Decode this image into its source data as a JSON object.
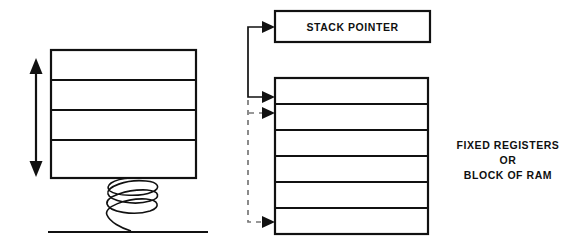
{
  "diagram": {
    "stack_pointer": {
      "label": "STACK POINTER",
      "box": {
        "x": 275,
        "y": 11,
        "width": 155,
        "height": 31
      }
    },
    "register_block": {
      "caption_lines": [
        "FIXED REGISTERS",
        "OR",
        "BLOCK OF RAM"
      ],
      "row_count": 6,
      "box": {
        "x": 275,
        "y": 78,
        "width": 153,
        "height": 156
      },
      "caption_position": {
        "x": 508,
        "y": 149
      }
    },
    "stack_box": {
      "row_count": 4,
      "box": {
        "x": 51,
        "y": 50,
        "width": 145,
        "height": 128
      }
    },
    "spring": {
      "name": "coil-spring",
      "coils": 4,
      "x_center": 130,
      "top": 178,
      "bottom": 232,
      "radius_x": 26
    },
    "ground": {
      "x1": 48,
      "x2": 208,
      "y": 232
    },
    "double_arrow": {
      "name": "vertical-travel-arrow",
      "x": 36,
      "top": 63,
      "bottom": 172
    },
    "connector": {
      "name": "stack-pointer-connector",
      "trunk_x": 248,
      "solid_top": 27,
      "solid_bottom": 100,
      "dashed_top": 100,
      "dashed_bottom": 215,
      "arrows": [
        {
          "name": "arrow-to-stack-pointer",
          "y": 27,
          "target_x": 275,
          "style": "solid"
        },
        {
          "name": "arrow-to-register-row-1",
          "y": 97,
          "target_x": 275,
          "style": "solid"
        },
        {
          "name": "arrow-to-register-row-2",
          "y": 113,
          "target_x": 275,
          "style": "dashed"
        },
        {
          "name": "arrow-to-register-row-6",
          "y": 222,
          "target_x": 275,
          "style": "dashed"
        }
      ]
    },
    "colors": {
      "stroke": "#111111",
      "dashed_stroke": "#777777",
      "background": "#ffffff",
      "text": "#101010"
    }
  }
}
